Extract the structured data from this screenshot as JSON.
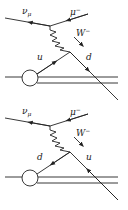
{
  "diagrams": [
    {
      "name": "feynman-diagram-top",
      "labels": {
        "neutrino": "ν",
        "neutrino_sub": "μ",
        "muon": "μ",
        "muon_sup": "−",
        "boson": "W",
        "boson_sup": "−",
        "incoming_quark": "u",
        "outgoing_quark": "d"
      }
    },
    {
      "name": "feynman-diagram-bottom",
      "labels": {
        "neutrino": "ν",
        "neutrino_sub": "μ",
        "muon": "μ",
        "muon_sup": "−",
        "boson": "W",
        "boson_sup": "−",
        "left_quark": "d",
        "right_quark": "u"
      }
    }
  ],
  "colors": {
    "stroke": "#222222",
    "background": "#ffffff"
  }
}
